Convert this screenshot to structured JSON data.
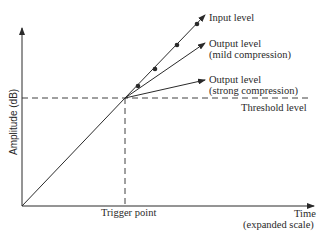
{
  "diagram": {
    "y_axis_label": "Amplitude (dB)",
    "x_axis_label_line1": "Time",
    "x_axis_label_line2": "(expanded scale)",
    "trigger_label": "Trigger point",
    "threshold_label": "Threshold level",
    "lines": [
      {
        "name": "input",
        "label_line1": "Input level",
        "label_line2": ""
      },
      {
        "name": "mild",
        "label_line1": "Output level",
        "label_line2": "(mild compression)"
      },
      {
        "name": "strong",
        "label_line1": "Output level",
        "label_line2": "(strong compression)"
      }
    ],
    "colors": {
      "ink": "#2a2a2a",
      "background": "#ffffff"
    }
  }
}
